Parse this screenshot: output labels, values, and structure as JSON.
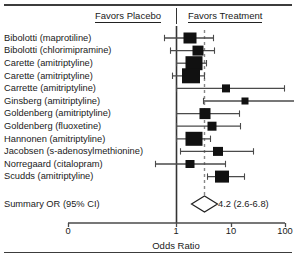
{
  "header": {
    "left_label": "Favors Placebo",
    "right_label": "Favors Treatment"
  },
  "axis": {
    "title": "Odds Ratio",
    "tick_labels": [
      "0",
      "1",
      "10",
      "100"
    ]
  },
  "summary": {
    "label": "Summary OR (95% CI)",
    "value_text": "4.2 (2.6-6.8)"
  },
  "colors": {
    "marker": "#111111",
    "line": "#4a4a4a",
    "null_line": "#333333",
    "summary_line": "#888888",
    "text": "#1a1a1a",
    "rule": "#3c3c3c"
  },
  "chart_data": {
    "type": "forest",
    "title": "",
    "xlabel": "Odds Ratio",
    "ylabel": "",
    "xscale": "log-like",
    "xlim": [
      0,
      100
    ],
    "xticks": [
      0,
      1,
      10,
      100
    ],
    "xtick_px": [
      68,
      176,
      231,
      285
    ],
    "grid": false,
    "null_value": 1,
    "summary_line_value": 4.2,
    "legend": [],
    "annotations": [
      "Favors Placebo",
      "Favors Treatment"
    ],
    "summary": {
      "label": "Summary OR (95% CI)",
      "or": 4.2,
      "ci_low": 2.6,
      "ci_high": 6.8,
      "value_text": "4.2 (2.6-6.8)"
    },
    "studies": [
      {
        "label": "Bibolotti (maprotiline)",
        "center_px": 190,
        "ci_low_px": 164,
        "ci_high_px": 214,
        "box_w": 13,
        "box_h": 11
      },
      {
        "label": "Bibolotti (chlorimipramine)",
        "center_px": 198,
        "ci_low_px": 170,
        "ci_high_px": 215,
        "box_w": 11,
        "box_h": 10
      },
      {
        "label": "Carette (amitriptyline)",
        "center_px": 194,
        "ci_low_px": 176,
        "ci_high_px": 207,
        "box_w": 17,
        "box_h": 14
      },
      {
        "label": "Carette (amitriptyline)",
        "center_px": 191,
        "ci_low_px": 172,
        "ci_high_px": 205,
        "box_w": 18,
        "box_h": 15
      },
      {
        "label": "Carrette (amitriptyline)",
        "center_px": 226,
        "ci_low_px": 176,
        "ci_high_px": 285,
        "box_w": 8,
        "box_h": 8
      },
      {
        "label": "Ginsberg (amitriptyline)",
        "center_px": 245,
        "ci_low_px": 203,
        "ci_high_px": 294,
        "box_w": 7,
        "box_h": 7
      },
      {
        "label": "Goldenberg (amitriptyline)",
        "center_px": 205,
        "ci_low_px": 176,
        "ci_high_px": 240,
        "box_w": 11,
        "box_h": 11
      },
      {
        "label": "Goldenberg (fluoxetine)",
        "center_px": 212,
        "ci_low_px": 176,
        "ci_high_px": 241,
        "box_w": 9,
        "box_h": 9
      },
      {
        "label": "Hannonen (amitriptyline)",
        "center_px": 194,
        "ci_low_px": 176,
        "ci_high_px": 211,
        "box_w": 17,
        "box_h": 14
      },
      {
        "label": "Jacobsen (s-adenosylmethionine)",
        "center_px": 218,
        "ci_low_px": 180,
        "ci_high_px": 254,
        "box_w": 10,
        "box_h": 9
      },
      {
        "label": "Norregaard (citalopram)",
        "center_px": 190,
        "ci_low_px": 155,
        "ci_high_px": 226,
        "box_w": 9,
        "box_h": 8
      },
      {
        "label": "Scudds (amitriptyline)",
        "center_px": 222,
        "ci_low_px": 207,
        "ci_high_px": 245,
        "box_w": 14,
        "box_h": 12
      }
    ]
  },
  "layout": {
    "row_y_start": 38,
    "row_step": 12.6,
    "summary_y": 204,
    "axis_y": 223,
    "tick_label_y": 226,
    "label_x": 4
  }
}
